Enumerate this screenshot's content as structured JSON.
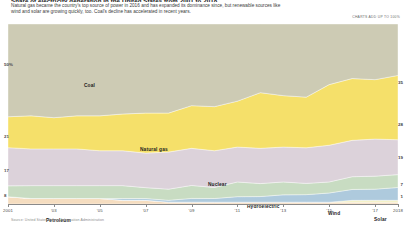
{
  "header": {
    "headline": "Share of electricity generation in the United States from 2001 to 2018",
    "subhead": "Natural gas became the country's top source of power in 2016 and has expanded its dominance since, but renewable sources like wind and solar are growing quickly, too. Coal's decline has accelerated in recent years.",
    "charts_note": "Charts add up to 100%"
  },
  "source": "Source: United States Energy Information Administration",
  "chart_data": {
    "type": "area",
    "title": "Share of electricity generation in the United States from 2001 to 2018",
    "xlabel": "",
    "ylabel": "",
    "ylim": [
      0,
      100
    ],
    "grid": false,
    "legend": "inline-band-labels",
    "stacked": true,
    "unit": "percent",
    "x": [
      2001,
      2002,
      2003,
      2004,
      2005,
      2006,
      2007,
      2008,
      2009,
      2010,
      2011,
      2012,
      2013,
      2014,
      2015,
      2016,
      2017,
      2018
    ],
    "xtick_labels": [
      "2001",
      "'03",
      "'05",
      "'07",
      "'09",
      "'11",
      "'13",
      "'15",
      "'17",
      "2018"
    ],
    "xtick_values": [
      2001,
      2003,
      2005,
      2007,
      2009,
      2011,
      2013,
      2015,
      2017,
      2018
    ],
    "ytick_labels": [
      "50%",
      "21",
      "17",
      "8"
    ],
    "ytick_left_values": [
      50,
      21,
      17,
      8
    ],
    "end_labels": [
      {
        "series": "Natural gas",
        "value": 35
      },
      {
        "series": "Coal",
        "value": 28
      },
      {
        "series": "Nuclear",
        "value": 19
      },
      {
        "series": "Wind",
        "value": 7
      },
      {
        "series": "Solar",
        "value": 1
      }
    ],
    "series": [
      {
        "name": "Coal",
        "color": "#cdcbb4",
        "label_x": 2004,
        "values": [
          51,
          50,
          51,
          50,
          50,
          49,
          49,
          48,
          44,
          45,
          42,
          37,
          39,
          39,
          33,
          30,
          30,
          28
        ]
      },
      {
        "name": "Natural gas",
        "color": "#f5e06a",
        "label_x": 2007,
        "values": [
          17,
          18,
          17,
          18,
          19,
          20,
          22,
          21,
          23,
          24,
          25,
          30,
          28,
          27,
          33,
          34,
          32,
          35
        ]
      },
      {
        "name": "Nuclear",
        "color": "#dcd2da",
        "label_x": 2009,
        "values": [
          21,
          20,
          20,
          20,
          19,
          19,
          19,
          20,
          20,
          20,
          19,
          19,
          19,
          19,
          20,
          20,
          20,
          19
        ]
      },
      {
        "name": "Hydroelectric",
        "color": "#c8dcc2",
        "label_x": 2011,
        "values": [
          6,
          7,
          7,
          7,
          7,
          7,
          6,
          6,
          7,
          6,
          8,
          7,
          7,
          6,
          6,
          7,
          7,
          7
        ]
      },
      {
        "name": "Wind",
        "color": "#aecadd",
        "label_x": 2014,
        "values": [
          0,
          0,
          0,
          0,
          0,
          1,
          1,
          1,
          2,
          2,
          3,
          3,
          4,
          4,
          5,
          6,
          6,
          7
        ]
      },
      {
        "name": "Solar",
        "color": "#f3f0c0",
        "label_x": 2017,
        "values": [
          0,
          0,
          0,
          0,
          0,
          0,
          0,
          0,
          0,
          0,
          0,
          0,
          0,
          0,
          0,
          1,
          1,
          1
        ]
      },
      {
        "name": "Petroleum",
        "color": "#f5ddc0",
        "label_x": 2002,
        "values": [
          4,
          3,
          3,
          3,
          3,
          2,
          2,
          1,
          1,
          1,
          1,
          1,
          1,
          1,
          1,
          1,
          1,
          1
        ]
      }
    ],
    "band_labels": [
      {
        "text": "Coal",
        "x": 84,
        "y": 62
      },
      {
        "text": "Natural gas",
        "x": 140,
        "y": 126
      },
      {
        "text": "Nuclear",
        "x": 208,
        "y": 161
      },
      {
        "text": "Hydroelectric",
        "x": 247,
        "y": 183
      },
      {
        "text": "Wind",
        "x": 328,
        "y": 190
      },
      {
        "text": "Solar",
        "x": 374,
        "y": 196
      },
      {
        "text": "Petroleum",
        "x": 46,
        "y": 197
      }
    ],
    "colors": {
      "coal": "#cdcbb4",
      "natural_gas": "#f5e06a",
      "nuclear": "#dcd2da",
      "hydroelectric": "#c8dcc2",
      "wind": "#aecadd",
      "solar": "#f3f0c0",
      "petroleum": "#f5ddc0",
      "axis": "#8a8a8a",
      "text": "#1a1a1a"
    }
  }
}
